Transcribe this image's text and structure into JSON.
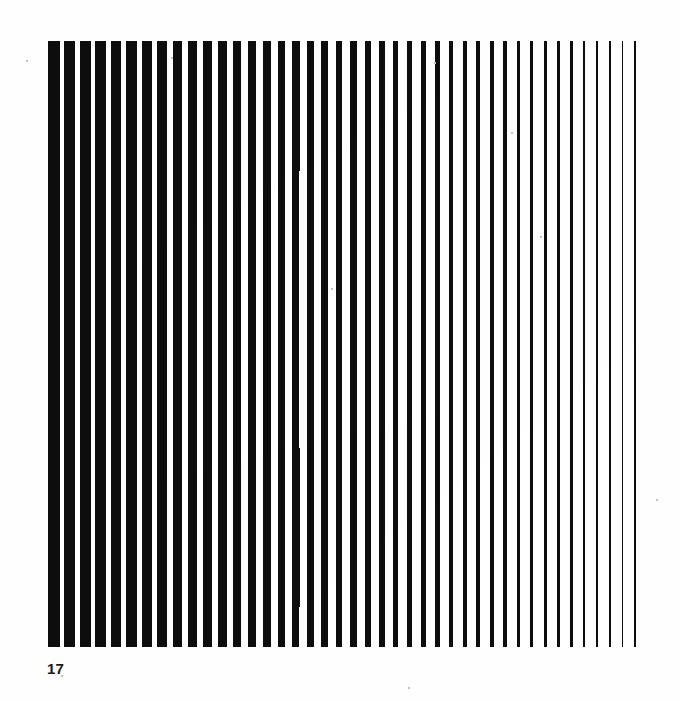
{
  "page": {
    "background_color": "#fefefe",
    "width": 680,
    "height": 701
  },
  "caption": {
    "plate_number": "17"
  },
  "artwork": {
    "title": "Optical stripe composition",
    "style": "op-art",
    "ink_color": "#0d0d0d",
    "paper_color": "#ffffff",
    "field": {
      "x": 48,
      "y": 41,
      "width": 588,
      "height": 606
    },
    "stripes": {
      "count": 42,
      "orientation": "vertical",
      "first_bar_width": 26.5,
      "last_bar_width": 3.4,
      "first_pitch": 35.0,
      "last_pitch": 28.0,
      "description": "Vertical bars whose width tapers from wide at the left edge to hairline at the right edge."
    },
    "inversion_shapes": [
      {
        "name": "upper-parallelogram",
        "points": "133,266 441,90 441,414 133,487",
        "description": "Large leaning quadrilateral whose interior reverses the black and white of the stripe field."
      },
      {
        "name": "lower-parallelogram",
        "points": "293,612 636,346 636,647 293,647",
        "description": "Second leaning quadrilateral toward the lower right that again reverses the stripe polarity."
      }
    ],
    "speckles": [
      {
        "x": 27,
        "y": 61,
        "r": 1.3
      },
      {
        "x": 172,
        "y": 58,
        "r": 1.1
      },
      {
        "x": 435,
        "y": 63,
        "r": 1.2
      },
      {
        "x": 512,
        "y": 133,
        "r": 1.1
      },
      {
        "x": 541,
        "y": 237,
        "r": 1.2
      },
      {
        "x": 332,
        "y": 289,
        "r": 1.0
      },
      {
        "x": 62,
        "y": 676,
        "r": 1.1
      },
      {
        "x": 409,
        "y": 688,
        "r": 1.2
      },
      {
        "x": 657,
        "y": 500,
        "r": 1.0
      }
    ]
  }
}
